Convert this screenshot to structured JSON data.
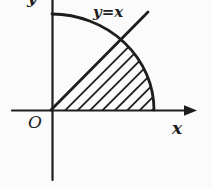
{
  "figure": {
    "labels": {
      "origin": "O",
      "x_axis": "x",
      "y_axis": "y",
      "line_equation": "y=x"
    },
    "colors": {
      "ink": "#1e1e1e",
      "background": "#fbfbfb"
    }
  }
}
